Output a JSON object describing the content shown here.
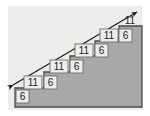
{
  "figure": {
    "type": "geometry-diagram",
    "canvas": {
      "width": 150,
      "height": 116
    },
    "colors": {
      "page_background": "#ffffff",
      "panel_background": "#ededeb",
      "step_fill": "#a8a8a8",
      "outline": "#4a4a4a",
      "arrow": "#1a1a1a",
      "label_text": "#1a1a1a",
      "label_box_fill": "#d6d6d4",
      "label_box_stroke": "#6e6e6e"
    },
    "panel": {
      "x": 8,
      "y": 6,
      "width": 134,
      "height": 104
    },
    "staircase": {
      "description": "Right-ascending staircase of five steps, shaded gray, bounded below by a horizontal base line and on the right by a vertical line.",
      "step_count": 5,
      "tread_label": "11",
      "riser_label": "6",
      "base_y": 107,
      "left_x": 15,
      "right_x": 142,
      "steps": [
        {
          "index": 1,
          "x_start": 15,
          "x_end": 44,
          "top_y": 88
        },
        {
          "index": 2,
          "x_start": 44,
          "x_end": 70,
          "top_y": 72
        },
        {
          "index": 3,
          "x_start": 70,
          "x_end": 95,
          "top_y": 56
        },
        {
          "index": 4,
          "x_start": 95,
          "x_end": 119,
          "top_y": 41
        },
        {
          "index": 5,
          "x_start": 119,
          "x_end": 142,
          "top_y": 26
        }
      ]
    },
    "arrow": {
      "description": "Double-headed diagonal line running from lower-left to upper-right across the staircase corners.",
      "from": {
        "x": 11,
        "y": 86
      },
      "to": {
        "x": 139,
        "y": 11
      },
      "heads": "both"
    },
    "labels": [
      {
        "id": "tread-1",
        "text": "11",
        "x": 30,
        "y": 85,
        "kind": "tread"
      },
      {
        "id": "riser-1",
        "text": "6",
        "x": 50,
        "y": 85,
        "kind": "riser"
      },
      {
        "id": "tread-2",
        "text": "11",
        "x": 56,
        "y": 69,
        "kind": "tread"
      },
      {
        "id": "riser-2",
        "text": "6",
        "x": 76,
        "y": 69,
        "kind": "riser"
      },
      {
        "id": "tread-3",
        "text": "11",
        "x": 81,
        "y": 54,
        "kind": "tread"
      },
      {
        "id": "riser-3",
        "text": "6",
        "x": 101,
        "y": 54,
        "kind": "riser"
      },
      {
        "id": "tread-4",
        "text": "11",
        "x": 105,
        "y": 39,
        "kind": "tread"
      },
      {
        "id": "riser-4",
        "text": "6",
        "x": 125,
        "y": 39,
        "kind": "riser"
      },
      {
        "id": "tread-5",
        "text": "11",
        "x": 129,
        "y": 24,
        "kind": "tread"
      },
      {
        "id": "base",
        "text": "6",
        "x": 22,
        "y": 100,
        "kind": "base"
      }
    ]
  }
}
